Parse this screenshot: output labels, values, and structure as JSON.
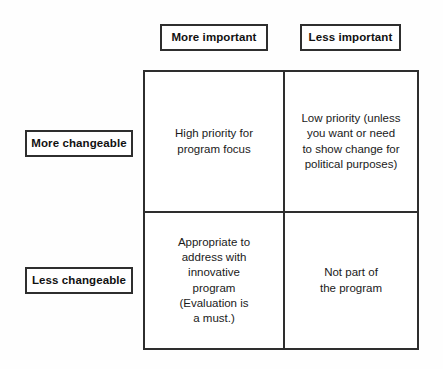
{
  "diagram": {
    "type": "2x2-matrix",
    "border_color": "#2e2e2e",
    "background_color": "#ffffff",
    "text_color": "#1a1a1a",
    "column_headers": [
      {
        "id": "more-important",
        "label": "More important"
      },
      {
        "id": "less-important",
        "label": "Less important"
      }
    ],
    "row_headers": [
      {
        "id": "more-changeable",
        "label": "More changeable"
      },
      {
        "id": "less-changeable",
        "label": "Less changeable"
      }
    ],
    "quadrants": {
      "top_left": {
        "row": "More changeable",
        "column": "More important",
        "text": "High priority for\nprogram focus"
      },
      "top_right": {
        "row": "More changeable",
        "column": "Less important",
        "text": "Low priority (unless\nyou want or need\nto show change for\npolitical purposes)"
      },
      "bottom_left": {
        "row": "Less changeable",
        "column": "More important",
        "text": "Appropriate to\naddress with\ninnovative\nprogram\n(Evaluation is\na must.)"
      },
      "bottom_right": {
        "row": "Less changeable",
        "column": "Less important",
        "text": "Not part of\nthe program"
      }
    }
  }
}
